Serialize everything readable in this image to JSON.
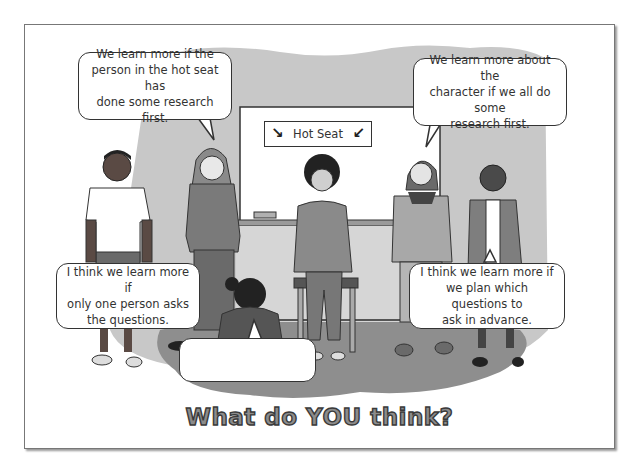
{
  "scene": {
    "sign_text": "Hot Seat",
    "sign_arrows": [
      "↘",
      "↙"
    ],
    "caption": "What do YOU think?"
  },
  "bubbles": [
    {
      "id": "top-left",
      "text": "We learn more if the\nperson in the hot seat has\ndone some research first."
    },
    {
      "id": "top-right",
      "text": "We learn more about the\ncharacter if we all do some\nresearch first."
    },
    {
      "id": "bottom-left",
      "text": "I think we learn more if\nonly one person asks\nthe questions."
    },
    {
      "id": "bottom-right",
      "text": "I think we learn more if\nwe plan which questions to\nask in advance."
    },
    {
      "id": "bottom-center-empty",
      "text": ""
    }
  ],
  "colors": {
    "background_blob": "#c8c8c8",
    "floor": "#8e8e8e",
    "whiteboard": "#ffffff",
    "wall_panel": "#d6d6d6",
    "outline": "#333333"
  }
}
